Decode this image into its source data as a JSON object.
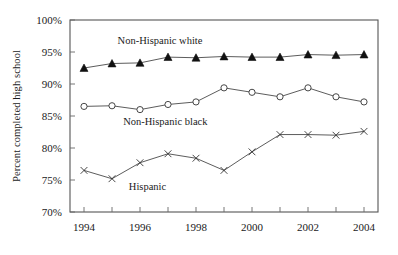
{
  "chart_data": {
    "type": "line",
    "title": "",
    "subtitle": "",
    "xlabel": "",
    "ylabel": "Percent completed high school",
    "x": [
      1994,
      1995,
      1996,
      1997,
      1998,
      1999,
      2000,
      2001,
      2002,
      2003,
      2004
    ],
    "xlim": [
      1993.5,
      2004.5
    ],
    "ylim": [
      70,
      100
    ],
    "ytick_values": [
      70,
      75,
      80,
      85,
      90,
      95,
      100
    ],
    "ytick_labels": [
      "70%",
      "75%",
      "80%",
      "85%",
      "90%",
      "95%",
      "100%"
    ],
    "xtick_values": [
      1994,
      1995,
      1996,
      1997,
      1998,
      1999,
      2000,
      2001,
      2002,
      2003,
      2004
    ],
    "xtick_labels": [
      "1994",
      "",
      "1996",
      "",
      "1998",
      "",
      "2000",
      "",
      "2002",
      "",
      "2004"
    ],
    "grid": false,
    "legend_position": "inline-annotations",
    "series": [
      {
        "name": "Non-Hispanic white",
        "marker": "filled-triangle",
        "values": [
          92.5,
          93.2,
          93.3,
          94.2,
          94.1,
          94.3,
          94.2,
          94.2,
          94.6,
          94.5,
          94.6
        ],
        "label_x": 1995.2,
        "label_y": 96.3
      },
      {
        "name": "Non-Hispanic black",
        "marker": "open-circle",
        "values": [
          86.5,
          86.6,
          86.0,
          86.8,
          87.2,
          89.4,
          88.7,
          88.0,
          89.4,
          88.0,
          87.2
        ],
        "label_x": 1995.4,
        "label_y": 83.6
      },
      {
        "name": "Hispanic",
        "marker": "cross-x",
        "values": [
          76.5,
          75.2,
          77.7,
          79.1,
          78.4,
          76.5,
          79.4,
          82.1,
          82.1,
          82.0,
          82.6
        ],
        "label_x": 1995.6,
        "label_y": 73.4
      }
    ]
  },
  "axis": {
    "ylabel": "Percent completed high school"
  }
}
